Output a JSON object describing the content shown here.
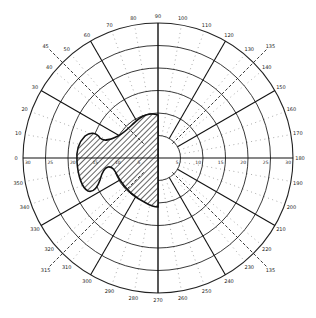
{
  "chart_data": {
    "type": "polar-perimetry",
    "title": "",
    "center_px": [
      158,
      158
    ],
    "outer_radius_px": 135,
    "angle_convention": "0 at left (west), 90 at top, 180 at right, 270 at bottom; counter-clockwise from left via top",
    "radial_rings": [
      5,
      10,
      15,
      20,
      25,
      30
    ],
    "radial_tick_labels_left": [
      "30",
      "25",
      "20",
      "15",
      "10",
      "5"
    ],
    "radial_tick_labels_right": [
      "5",
      "10",
      "15",
      "20",
      "25",
      "30"
    ],
    "angle_labels": [
      "0",
      "10",
      "20",
      "30",
      "40",
      "50",
      "60",
      "70",
      "80",
      "90",
      "100",
      "110",
      "120",
      "130",
      "140",
      "150",
      "160",
      "170",
      "180",
      "190",
      "200",
      "210",
      "220",
      "230",
      "240",
      "250",
      "260",
      "270",
      "280",
      "290",
      "300",
      "310",
      "320",
      "330",
      "340",
      "350"
    ],
    "solid_meridians": [
      0,
      30,
      60,
      90,
      120,
      150,
      180,
      210,
      240,
      270,
      300,
      330
    ],
    "dashed_meridians": [
      {
        "angle": 45,
        "label": "45"
      },
      {
        "angle": 135,
        "label": "135"
      },
      {
        "angle": 225,
        "label": "315"
      },
      {
        "angle": 315,
        "label": "135"
      }
    ],
    "dotted_meridians": [
      10,
      20,
      40,
      50,
      70,
      80,
      100,
      110,
      130,
      140,
      160,
      170,
      190,
      200,
      220,
      230,
      250,
      260,
      280,
      290,
      310,
      320,
      340,
      350
    ],
    "shaded_region": {
      "description": "Hatched scotoma region occupying left half near center, bounded on right by vertical 90-270 meridian",
      "extent_deg_left": 18,
      "extent_deg_up": 10,
      "extent_deg_down": 11
    },
    "grid": true,
    "legend": null
  },
  "labels": {
    "outer_extra_tl": "45",
    "outer_extra_tr": "135",
    "outer_extra_bl": "315",
    "outer_extra_br": "135"
  }
}
